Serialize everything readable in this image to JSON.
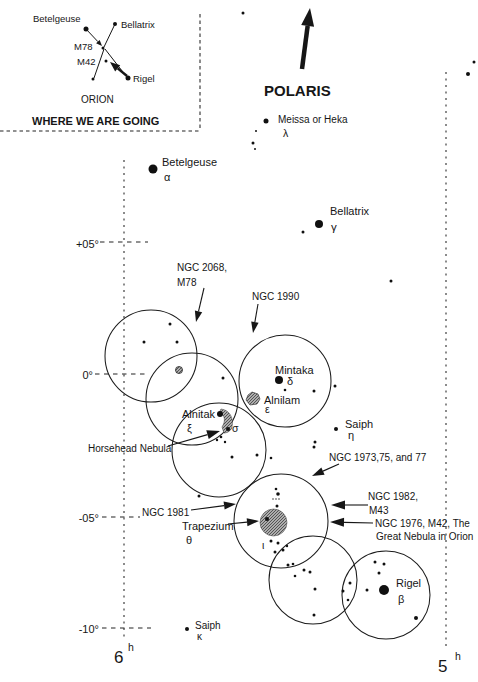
{
  "meta": {
    "background": "#ffffff",
    "ink": "#161616",
    "hatch_fill": "#adadad"
  },
  "inset": {
    "texts": [
      {
        "id": "inset-betelgeuse",
        "t": "Betelgeuse",
        "x": 33,
        "y": 22,
        "s": 9.5
      },
      {
        "id": "inset-bellatrix",
        "t": "Bellatrix",
        "x": 121,
        "y": 28,
        "s": 9.5
      },
      {
        "id": "inset-m78",
        "t": "M78",
        "x": 74,
        "y": 50,
        "s": 9.5
      },
      {
        "id": "inset-m42",
        "t": "M42",
        "x": 77,
        "y": 65,
        "s": 9.5
      },
      {
        "id": "inset-rigel",
        "t": "Rigel",
        "x": 133,
        "y": 82,
        "s": 9.5
      },
      {
        "id": "inset-orion",
        "t": "ORION",
        "x": 81,
        "y": 103,
        "s": 10
      },
      {
        "id": "inset-caption",
        "t": "WHERE WE ARE GOING",
        "x": 32,
        "y": 125,
        "s": 11,
        "w": 600
      }
    ],
    "dots": [
      [
        86,
        29,
        2.5,
        "star-inset-betelgeuse"
      ],
      [
        115,
        24,
        2,
        "star-inset-bellatrix"
      ],
      [
        103,
        48,
        1.5,
        "star-inset-belt"
      ],
      [
        106,
        61,
        1.5,
        "star-inset-m42"
      ],
      [
        93,
        79,
        1.5,
        "star-inset-foot"
      ],
      [
        128,
        78,
        2.5,
        "star-inset-rigel"
      ]
    ],
    "lines": [
      [
        115,
        24,
        104,
        47
      ],
      [
        104,
        49,
        94,
        78
      ],
      [
        105,
        49,
        126,
        76
      ]
    ],
    "border_lines": [
      {
        "id": "inset-border-right",
        "x1": 200,
        "y1": 14,
        "x2": 200,
        "y2": 131
      },
      {
        "id": "inset-border-bottom",
        "x1": 0,
        "y1": 131,
        "x2": 200,
        "y2": 131
      }
    ],
    "belt_pointer": {
      "id": "inset-belt-pointer",
      "x1": 86,
      "y1": 29,
      "x2": 102,
      "y2": 46,
      "sw": 1,
      "hl": 6,
      "hw": 5
    },
    "go_arrow": {
      "id": "inset-go-arrow",
      "x1": 127,
      "y1": 76,
      "x2": 110,
      "y2": 62,
      "sw": 2.5,
      "hl": 10,
      "hw": 8
    }
  },
  "polaris": {
    "label": {
      "id": "polaris",
      "t": "POLARIS",
      "x": 264,
      "y": 96,
      "s": 15,
      "w": 700
    },
    "arrow": {
      "id": "polaris-arrow",
      "x1": 302,
      "y1": 69,
      "x2": 310,
      "y2": 8,
      "sw": 4.5,
      "hl": 18,
      "hw": 13
    }
  },
  "grid": {
    "dec_texts": [
      {
        "id": "dec-plus05",
        "t": "+05°",
        "x": 99,
        "y": 248,
        "s": 11,
        "a": "end"
      },
      {
        "id": "dec-zero",
        "t": "0°",
        "x": 93,
        "y": 379,
        "s": 11,
        "a": "end"
      },
      {
        "id": "dec-minus05",
        "t": "-05°",
        "x": 99,
        "y": 522,
        "s": 11,
        "a": "end"
      },
      {
        "id": "dec-minus10",
        "t": "-10°",
        "x": 99,
        "y": 633,
        "s": 11,
        "a": "end"
      }
    ],
    "ra_texts": [
      {
        "id": "ra-6",
        "t": "6",
        "x": 114,
        "y": 663,
        "s": 17
      },
      {
        "id": "ra-6-sup",
        "t": "h",
        "x": 128,
        "y": 651,
        "s": 10.5
      },
      {
        "id": "ra-5",
        "t": "5",
        "x": 438,
        "y": 672,
        "s": 17
      },
      {
        "id": "ra-5-sup",
        "t": "h",
        "x": 455,
        "y": 660,
        "s": 10.5
      }
    ],
    "verticals": [
      {
        "id": "grid-line-left",
        "x1": 124,
        "y1": 160,
        "x2": 124,
        "y2": 638
      },
      {
        "id": "grid-line-right",
        "x1": 446,
        "y1": 72,
        "x2": 446,
        "y2": 650
      }
    ],
    "ticks": [
      {
        "id": "tick-plus05",
        "x1": 100,
        "y1": 242,
        "x2": 148,
        "y2": 242
      },
      {
        "id": "tick-zero",
        "x1": 95,
        "y1": 374,
        "x2": 148,
        "y2": 374
      },
      {
        "id": "tick-minus05",
        "x1": 102,
        "y1": 517,
        "x2": 140,
        "y2": 517
      },
      {
        "id": "tick-minus10",
        "x1": 102,
        "y1": 628,
        "x2": 151,
        "y2": 628
      }
    ]
  },
  "field_circles": [
    {
      "id": "fov-m78",
      "cx": 151,
      "cy": 356,
      "r": 46
    },
    {
      "id": "fov-alnitak",
      "cx": 192,
      "cy": 399,
      "r": 46
    },
    {
      "id": "fov-mintaka",
      "cx": 285,
      "cy": 381,
      "r": 46
    },
    {
      "id": "fov-sigma",
      "cx": 219,
      "cy": 450,
      "r": 47
    },
    {
      "id": "fov-trapezium",
      "cx": 281,
      "cy": 521,
      "r": 47
    },
    {
      "id": "fov-south",
      "cx": 313,
      "cy": 580,
      "r": 44
    },
    {
      "id": "fov-rigel",
      "cx": 386,
      "cy": 595,
      "r": 44
    }
  ],
  "objects": {
    "texts": [
      {
        "id": "meissa",
        "t": "Meissa or Heka",
        "x": 278,
        "y": 123,
        "s": 10
      },
      {
        "id": "lambda",
        "t": "λ",
        "x": 283,
        "y": 137,
        "s": 10.5
      },
      {
        "id": "betelgeuse",
        "t": "Betelgeuse",
        "x": 162,
        "y": 166,
        "s": 11
      },
      {
        "id": "alpha",
        "t": "α",
        "x": 164,
        "y": 181,
        "s": 11
      },
      {
        "id": "bellatrix",
        "t": "Bellatrix",
        "x": 330,
        "y": 215,
        "s": 11
      },
      {
        "id": "gamma",
        "t": "γ",
        "x": 331,
        "y": 231,
        "s": 11.5
      },
      {
        "id": "ngc2068-line1",
        "t": "NGC 2068,",
        "x": 177,
        "y": 271,
        "s": 10
      },
      {
        "id": "ngc2068-line2",
        "t": "M78",
        "x": 177,
        "y": 286,
        "s": 10
      },
      {
        "id": "ngc1990",
        "t": "NGC 1990",
        "x": 252,
        "y": 300,
        "s": 10
      },
      {
        "id": "mintaka",
        "t": "Mintaka",
        "x": 275,
        "y": 374,
        "s": 11
      },
      {
        "id": "delta",
        "t": "δ",
        "x": 287,
        "y": 385,
        "s": 11
      },
      {
        "id": "alnilam",
        "t": "Alnilam",
        "x": 264,
        "y": 404,
        "s": 11
      },
      {
        "id": "epsilon",
        "t": "ε",
        "x": 265,
        "y": 413,
        "s": 10.5
      },
      {
        "id": "alnitak",
        "t": "Alnitak",
        "x": 182,
        "y": 418,
        "s": 11
      },
      {
        "id": "xi",
        "t": "ξ",
        "x": 187,
        "y": 432,
        "s": 11
      },
      {
        "id": "sigma",
        "t": "σ",
        "x": 232,
        "y": 432,
        "s": 10.5
      },
      {
        "id": "horsehead",
        "t": "Horsehead Nebula",
        "x": 88,
        "y": 452,
        "s": 10
      },
      {
        "id": "saiph-eta",
        "t": "Saiph",
        "x": 345,
        "y": 428,
        "s": 11
      },
      {
        "id": "eta",
        "t": "η",
        "x": 348,
        "y": 439,
        "s": 11
      },
      {
        "id": "ngc1973",
        "t": "NGC 1973,75, and 77",
        "x": 329,
        "y": 461,
        "s": 10
      },
      {
        "id": "ngc1982-line1",
        "t": "NGC 1982,",
        "x": 368,
        "y": 500,
        "s": 10
      },
      {
        "id": "ngc1982-line2",
        "t": "M43",
        "x": 369,
        "y": 514,
        "s": 10
      },
      {
        "id": "ngc1976-line1",
        "t": "NGC 1976, M42, The",
        "x": 375,
        "y": 527,
        "s": 10
      },
      {
        "id": "ngc1976-line2",
        "t": "Great Nebula in Orion",
        "x": 376,
        "y": 540,
        "s": 10
      },
      {
        "id": "ngc1981",
        "t": "NGC 1981",
        "x": 142,
        "y": 516,
        "s": 10
      },
      {
        "id": "trapezium",
        "t": "Trapezium",
        "x": 182,
        "y": 530,
        "s": 11
      },
      {
        "id": "theta",
        "t": "θ",
        "x": 186,
        "y": 544,
        "s": 11
      },
      {
        "id": "iota",
        "t": "ι",
        "x": 262,
        "y": 549,
        "s": 10.5
      },
      {
        "id": "rigel",
        "t": "Rigel",
        "x": 396,
        "y": 587,
        "s": 11
      },
      {
        "id": "beta",
        "t": "β",
        "x": 398,
        "y": 603,
        "s": 11
      },
      {
        "id": "saiph-kappa",
        "t": "Saiph",
        "x": 195,
        "y": 629,
        "s": 10
      },
      {
        "id": "kappa",
        "t": "κ",
        "x": 197,
        "y": 640,
        "s": 10
      }
    ],
    "dots": [
      [
        243,
        13,
        1.5
      ],
      [
        474,
        62,
        1.5
      ],
      [
        468,
        74,
        2
      ],
      [
        266,
        121,
        2.5,
        "star-meissa"
      ],
      [
        256,
        131,
        1
      ],
      [
        253,
        143,
        1.5
      ],
      [
        255,
        149,
        1
      ],
      [
        153,
        169,
        4.5,
        "star-betelgeuse"
      ],
      [
        319,
        224,
        4,
        "star-bellatrix"
      ],
      [
        303,
        232,
        1.5
      ],
      [
        391,
        281,
        1.5
      ],
      [
        170,
        324,
        1.5
      ],
      [
        144,
        342,
        1.5
      ],
      [
        177,
        342,
        1.5
      ],
      [
        223,
        378,
        1.5
      ],
      [
        279,
        380,
        4,
        "star-mintaka"
      ],
      [
        285,
        390,
        1.3
      ],
      [
        314,
        391,
        1.5
      ],
      [
        335,
        386,
        1.5
      ],
      [
        228,
        429,
        2,
        "star-sigma-orionis"
      ],
      [
        221,
        437,
        1.3
      ],
      [
        217,
        440,
        1.2
      ],
      [
        225,
        442,
        1.2
      ],
      [
        232,
        457,
        1.5
      ],
      [
        257,
        455,
        1.5
      ],
      [
        271,
        458,
        1.3
      ],
      [
        199,
        496,
        1.5
      ],
      [
        336,
        429,
        2,
        "star-eta-orionis"
      ],
      [
        315,
        442,
        1.5
      ],
      [
        314,
        447,
        1.5
      ],
      [
        276,
        489,
        1.3
      ],
      [
        278,
        494,
        1.8
      ],
      [
        273,
        499,
        0.7
      ],
      [
        276,
        499,
        0.7
      ],
      [
        279,
        499,
        0.7
      ],
      [
        277,
        506,
        1.5
      ],
      [
        267,
        519,
        2,
        "star-theta-trapezium"
      ],
      [
        271,
        541,
        1.5
      ],
      [
        278,
        543,
        1.5
      ],
      [
        275,
        552,
        1.5
      ],
      [
        283,
        550,
        1.5
      ],
      [
        287,
        546,
        1.2
      ],
      [
        288,
        565,
        1.5
      ],
      [
        293,
        564,
        1.3
      ],
      [
        304,
        570,
        1.5
      ],
      [
        310,
        572,
        1.5
      ],
      [
        295,
        576,
        1.3
      ],
      [
        315,
        589,
        1.5
      ],
      [
        314,
        615,
        1.5
      ],
      [
        343,
        591,
        1.5
      ],
      [
        350,
        583,
        1.5
      ],
      [
        348,
        600,
        1.3
      ],
      [
        384,
        590,
        5,
        "star-rigel"
      ],
      [
        375,
        562,
        1.5
      ],
      [
        384,
        564,
        1.5
      ],
      [
        379,
        573,
        1.5
      ],
      [
        367,
        590,
        1.5
      ],
      [
        416,
        618,
        2
      ],
      [
        187,
        629,
        2,
        "star-kappa-orionis"
      ]
    ],
    "arrows": [
      {
        "id": "arrow-ngc2068",
        "x1": 204,
        "y1": 288,
        "x2": 196,
        "y2": 322,
        "hl": 11,
        "hw": 7.5
      },
      {
        "id": "arrow-ngc1990",
        "x1": 258,
        "y1": 304,
        "x2": 253,
        "y2": 333,
        "hl": 11,
        "hw": 7.5
      },
      {
        "id": "arrow-horsehead",
        "x1": 168,
        "y1": 446,
        "x2": 220,
        "y2": 431,
        "hl": 13,
        "hw": 9
      },
      {
        "id": "arrow-ngc1973",
        "x1": 339,
        "y1": 464,
        "x2": 312,
        "y2": 476,
        "hl": 12,
        "hw": 8
      },
      {
        "id": "arrow-ngc1982",
        "x1": 368,
        "y1": 505,
        "x2": 331,
        "y2": 505,
        "hl": 14,
        "hw": 9
      },
      {
        "id": "arrow-ngc1976",
        "x1": 373,
        "y1": 523,
        "x2": 330,
        "y2": 522,
        "hl": 14,
        "hw": 9
      },
      {
        "id": "arrow-ngc1981",
        "x1": 191,
        "y1": 510,
        "x2": 236,
        "y2": 504,
        "hl": 12,
        "hw": 8
      },
      {
        "id": "arrow-trapezium",
        "x1": 228,
        "y1": 524,
        "x2": 259,
        "y2": 521,
        "hl": 12,
        "hw": 8
      }
    ],
    "nebulae": {
      "m78_patch": {
        "id": "nebula-m78",
        "cx": 179,
        "cy": 370,
        "r": 3.5
      },
      "alnilam_patch": {
        "id": "nebula-alnilam",
        "path": "M248,395 L252,392 L258,394 L260,399 L257,404 L250,405 L246,400 Z"
      },
      "alnitak_star": {
        "id": "star-alnitak",
        "cx": 220,
        "cy": 414,
        "r": 3
      },
      "alnitak_wedge": {
        "id": "nebula-alnitak-wedge",
        "path": "M221,409 C229,410 234,417 232,427 C231,431 227,433 224,433 L222,427 C226,421 225,414 219,413 Z"
      },
      "trapezium_patch": {
        "id": "nebula-trapezium",
        "cx": 273.5,
        "cy": 522.5,
        "r": 13.5
      }
    }
  }
}
